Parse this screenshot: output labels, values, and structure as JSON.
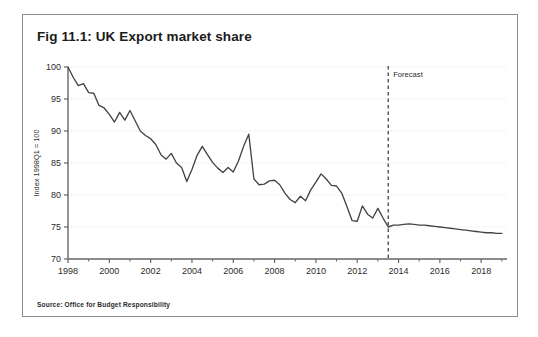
{
  "figure": {
    "title": "Fig 11.1: UK Export market share",
    "source": "Source: Office for Budget Responsibility"
  },
  "colors": {
    "line": "#444444",
    "axis": "#666666",
    "grid": "#d8d8d8",
    "border": "#8d8d8d",
    "text": "#2b2b2b",
    "background": "#ffffff"
  },
  "chart_data": {
    "type": "line",
    "title": "Fig 11.1: UK Export market share",
    "xlabel": "",
    "ylabel": "Index 1998Q1 = 100",
    "xlim": [
      1998,
      2019.25
    ],
    "ylim": [
      70,
      100
    ],
    "yticks": [
      70,
      75,
      80,
      85,
      90,
      95,
      100
    ],
    "xticks": [
      1998,
      2000,
      2002,
      2004,
      2006,
      2008,
      2010,
      2012,
      2014,
      2016,
      2018
    ],
    "grid": "horizontal-dotted",
    "legend": "none",
    "annotations": [
      {
        "name": "forecast-divider",
        "label": "Forecast",
        "x": 2013.5,
        "style": "dashed-vertical-line"
      }
    ],
    "series": [
      {
        "name": "UK export market share",
        "x": [
          1998.0,
          1998.25,
          1998.5,
          1998.75,
          1999.0,
          1999.25,
          1999.5,
          1999.75,
          2000.0,
          2000.25,
          2000.5,
          2000.75,
          2001.0,
          2001.25,
          2001.5,
          2001.75,
          2002.0,
          2002.25,
          2002.5,
          2002.75,
          2003.0,
          2003.25,
          2003.5,
          2003.75,
          2004.0,
          2004.25,
          2004.5,
          2004.75,
          2005.0,
          2005.25,
          2005.5,
          2005.75,
          2006.0,
          2006.25,
          2006.5,
          2006.75,
          2007.0,
          2007.25,
          2007.5,
          2007.75,
          2008.0,
          2008.25,
          2008.5,
          2008.75,
          2009.0,
          2009.25,
          2009.5,
          2009.75,
          2010.0,
          2010.25,
          2010.5,
          2010.75,
          2011.0,
          2011.25,
          2011.5,
          2011.75,
          2012.0,
          2012.25,
          2012.5,
          2012.75,
          2013.0,
          2013.25,
          2013.5,
          2013.75,
          2014.0,
          2014.25,
          2014.5,
          2014.75,
          2015.0,
          2015.25,
          2015.5,
          2015.75,
          2016.0,
          2016.25,
          2016.5,
          2016.75,
          2017.0,
          2017.25,
          2017.5,
          2017.75,
          2018.0,
          2018.25,
          2018.5,
          2018.75,
          2019.0
        ],
        "values": [
          100.0,
          98.4,
          97.1,
          97.4,
          96.0,
          95.9,
          94.0,
          93.6,
          92.6,
          91.4,
          92.9,
          91.7,
          93.2,
          91.6,
          90.0,
          89.3,
          88.8,
          87.9,
          86.3,
          85.6,
          86.5,
          85.0,
          84.3,
          82.1,
          84.0,
          86.2,
          87.6,
          86.3,
          85.1,
          84.2,
          83.5,
          84.3,
          83.6,
          85.3,
          87.6,
          89.5,
          82.5,
          81.6,
          81.7,
          82.2,
          82.3,
          81.6,
          80.3,
          79.3,
          78.8,
          79.8,
          79.1,
          80.8,
          82.0,
          83.3,
          82.5,
          81.5,
          81.4,
          80.3,
          78.2,
          76.0,
          75.9,
          78.3,
          77.0,
          76.4,
          77.9,
          76.4,
          75.0,
          75.3,
          75.3,
          75.4,
          75.5,
          75.4,
          75.3,
          75.3,
          75.2,
          75.1,
          75.0,
          74.9,
          74.8,
          74.7,
          74.6,
          74.5,
          74.4,
          74.3,
          74.2,
          74.1,
          74.1,
          74.0,
          74.0
        ]
      }
    ]
  }
}
